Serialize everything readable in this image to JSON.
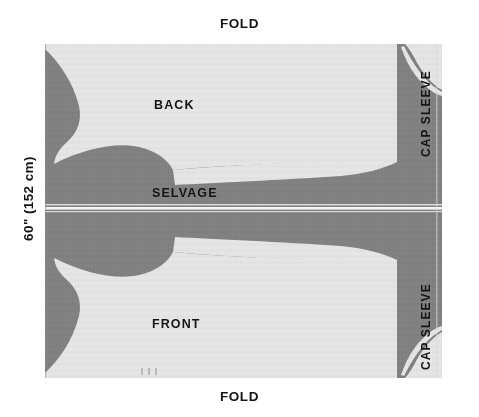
{
  "diagram": {
    "title_top": "FOLD",
    "title_bottom": "FOLD",
    "width_label": "60\" (152 cm)",
    "selvage_label": "SELVAGE",
    "pieces": [
      {
        "name": "BACK",
        "position": "upper-left"
      },
      {
        "name": "FRONT",
        "position": "lower-left"
      },
      {
        "name": "CAP SLEEVE",
        "position": "upper-right"
      },
      {
        "name": "CAP SLEEVE",
        "position": "lower-right"
      }
    ],
    "colors": {
      "fabric_dark": "#818181",
      "fabric_light": "#e6e6e6",
      "background": "#ffffff",
      "text": "#151515",
      "notch": "#b9b9b9"
    },
    "notches": {
      "count": 3,
      "label": ""
    }
  }
}
